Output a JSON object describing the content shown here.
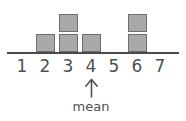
{
  "figure": {
    "name": "mean-dot-plot",
    "axis": {
      "line_color": "#4a4a4a",
      "tick_labels": [
        "1",
        "2",
        "3",
        "4",
        "5",
        "6",
        "7"
      ]
    },
    "square": {
      "fill_color": "#a9a9a9",
      "border_color": "#6e6e6e"
    },
    "annotation": {
      "arrow_icon": "up-arrow-icon",
      "label": "mean",
      "points_to_tick": "4"
    }
  },
  "chart_data": {
    "type": "bar",
    "title": "",
    "xlabel": "",
    "ylabel": "",
    "categories": [
      "1",
      "2",
      "3",
      "4",
      "5",
      "6",
      "7"
    ],
    "values": [
      0,
      1,
      2,
      1,
      0,
      2,
      0
    ],
    "ylim": [
      0,
      2
    ],
    "grid": false,
    "legend": null,
    "annotations": [
      {
        "text": "mean",
        "x": "4",
        "marker": "up-arrow-icon"
      }
    ]
  }
}
